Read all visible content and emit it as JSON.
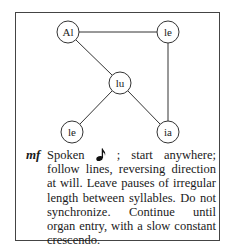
{
  "diagram": {
    "nodes": [
      {
        "id": "al",
        "label": "Al",
        "x": 68,
        "y": 32
      },
      {
        "id": "le_top",
        "label": "le",
        "x": 168,
        "y": 32
      },
      {
        "id": "lu",
        "label": "lu",
        "x": 120,
        "y": 83
      },
      {
        "id": "le_bottom",
        "label": "le",
        "x": 72,
        "y": 132
      },
      {
        "id": "ia",
        "label": "ia",
        "x": 168,
        "y": 132
      }
    ],
    "edges": [
      [
        "al",
        "le_top"
      ],
      [
        "al",
        "lu"
      ],
      [
        "le_top",
        "ia"
      ],
      [
        "lu",
        "le_bottom"
      ],
      [
        "lu",
        "ia"
      ]
    ]
  },
  "instructions": {
    "dynamic": "mf",
    "spoken": "Spoken",
    "note_icon": "eighth-note-icon",
    "rest": "; start anywhere; follow lines, reversing direction at will. Leave pauses of irregular length between syllables. Do not synchronize. Continue until organ entry, with a slow constant crescendo."
  },
  "colors": {
    "ink": "#222222",
    "border": "#444444",
    "background": "#ffffff"
  }
}
